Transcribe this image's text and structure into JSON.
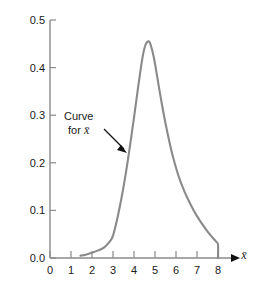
{
  "chart_data": {
    "type": "line",
    "title": "",
    "subtitle": "",
    "xlabel": "x̄",
    "ylabel": "",
    "xlim": [
      0,
      8.6
    ],
    "ylim": [
      0.0,
      0.5
    ],
    "grid": false,
    "legend": null,
    "x_ticks": [
      "0",
      "1",
      "2",
      "3",
      "4",
      "5",
      "6",
      "7",
      "8"
    ],
    "x_tick_values": [
      0,
      1,
      2,
      3,
      4,
      5,
      6,
      7,
      8
    ],
    "y_ticks": [
      "0.0",
      "0.1",
      "0.2",
      "0.3",
      "0.4",
      "0.5"
    ],
    "y_tick_values": [
      0.0,
      0.1,
      0.2,
      0.3,
      0.4,
      0.5
    ],
    "series": [
      {
        "name": "Curve for x̄",
        "color": "#8a8a8a",
        "x": [
          1.45,
          1.7,
          2.0,
          2.3,
          2.6,
          2.85,
          3.0,
          3.2,
          3.4,
          3.6,
          3.8,
          4.0,
          4.2,
          4.4,
          4.55,
          4.7,
          4.8,
          4.95,
          5.1,
          5.3,
          5.5,
          5.8,
          6.1,
          6.4,
          6.7,
          7.0,
          7.3,
          7.6,
          7.9,
          8.0,
          8.0
        ],
        "y": [
          0.005,
          0.007,
          0.011,
          0.016,
          0.023,
          0.035,
          0.047,
          0.082,
          0.125,
          0.175,
          0.233,
          0.295,
          0.36,
          0.42,
          0.448,
          0.455,
          0.447,
          0.42,
          0.382,
          0.33,
          0.283,
          0.222,
          0.175,
          0.14,
          0.112,
          0.088,
          0.068,
          0.05,
          0.035,
          0.028,
          0.0
        ]
      }
    ],
    "annotations": [
      {
        "name": "curve-label",
        "line1": "Curve",
        "line2_prefix": "for ",
        "line2_symbol": "x̄",
        "arrow": {
          "from_x": 3.05,
          "from_y": 0.268,
          "to_x": 3.62,
          "to_y": 0.224
        }
      }
    ],
    "axis_color": "#8a8a8a",
    "text_color": "#1a1a1a",
    "arrow_color": "#111111",
    "background": "#ffffff"
  }
}
